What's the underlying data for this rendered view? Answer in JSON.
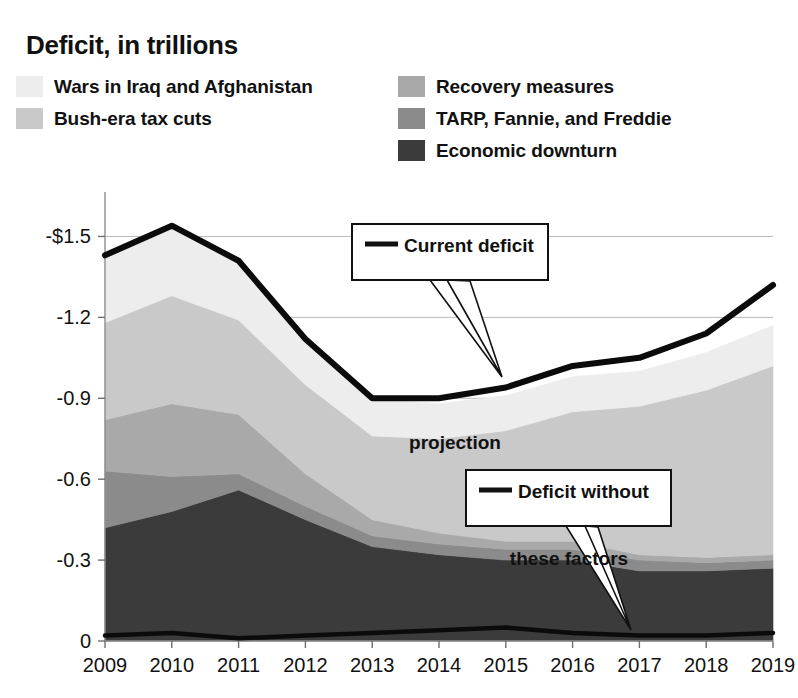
{
  "title": "Deficit, in trillions",
  "legend": {
    "left_items": [
      {
        "label": "Wars in Iraq and Afghanistan",
        "color": "#ededed",
        "key": "wars"
      },
      {
        "label": "Bush-era tax cuts",
        "color": "#c9c9c9",
        "key": "bush"
      }
    ],
    "right_items": [
      {
        "label": "Recovery measures",
        "color": "#a9a9a9",
        "key": "recovery"
      },
      {
        "label": "TARP, Fannie, and Freddie",
        "color": "#8b8b8b",
        "key": "tarp"
      },
      {
        "label": "Economic downturn",
        "color": "#3b3b3b",
        "key": "downturn"
      }
    ]
  },
  "annotations": [
    {
      "key": "current-deficit-projection",
      "line1": "Current deficit",
      "line2": "projection",
      "swatch_color": "#111111"
    },
    {
      "key": "deficit-without-these-factors",
      "line1": "Deficit without",
      "line2": "these factors",
      "swatch_color": "#111111"
    }
  ],
  "chart_data": {
    "type": "area",
    "stacked": true,
    "title": "Deficit, in trillions",
    "xlabel": "",
    "ylabel": "",
    "grid": true,
    "legend_position": "top",
    "note": "Stacked area of deficit components, plotted as negative trillions of dollars; magnitudes below are absolute trillions stacked from the zero baseline downward.",
    "x": [
      2009,
      2010,
      2011,
      2012,
      2013,
      2014,
      2015,
      2016,
      2017,
      2018,
      2019
    ],
    "xtick_labels": [
      "2009",
      "2010",
      "2011",
      "2012",
      "2013",
      "2014",
      "2015",
      "2016",
      "2017",
      "2018",
      "2019"
    ],
    "ytick_labels": [
      "-$1.5",
      "-1.2",
      "-0.9",
      "-0.6",
      "-0.3",
      "0"
    ],
    "ytick_values": [
      -1.5,
      -1.2,
      -0.9,
      -0.6,
      -0.3,
      0
    ],
    "ylim": [
      -1.65,
      0
    ],
    "xlim": [
      2009,
      2019
    ],
    "series": [
      {
        "name": "Economic downturn",
        "color": "#3b3b3b",
        "values": [
          0.42,
          0.48,
          0.56,
          0.45,
          0.35,
          0.32,
          0.3,
          0.3,
          0.26,
          0.26,
          0.27
        ]
      },
      {
        "name": "TARP, Fannie, and Freddie",
        "color": "#8b8b8b",
        "values": [
          0.21,
          0.13,
          0.06,
          0.05,
          0.04,
          0.04,
          0.04,
          0.04,
          0.04,
          0.03,
          0.03
        ]
      },
      {
        "name": "Recovery measures",
        "color": "#a9a9a9",
        "values": [
          0.19,
          0.27,
          0.22,
          0.12,
          0.06,
          0.04,
          0.03,
          0.03,
          0.02,
          0.02,
          0.02
        ]
      },
      {
        "name": "Bush-era tax cuts",
        "color": "#c9c9c9",
        "values": [
          0.36,
          0.4,
          0.35,
          0.33,
          0.31,
          0.35,
          0.41,
          0.48,
          0.55,
          0.62,
          0.7
        ]
      },
      {
        "name": "Wars in Iraq and Afghanistan",
        "color": "#ededed",
        "values": [
          0.25,
          0.26,
          0.22,
          0.17,
          0.14,
          0.13,
          0.13,
          0.13,
          0.13,
          0.14,
          0.15
        ]
      }
    ],
    "lines": [
      {
        "name": "Current deficit projection",
        "color": "#0b0b0b",
        "values": [
          -1.43,
          -1.54,
          -1.41,
          -1.12,
          -0.9,
          -0.9,
          -0.94,
          -1.02,
          -1.05,
          -1.14,
          -1.32
        ]
      },
      {
        "name": "Deficit without these factors",
        "color": "#0b0b0b",
        "values": [
          -0.02,
          -0.03,
          -0.01,
          -0.02,
          -0.03,
          -0.04,
          -0.05,
          -0.03,
          -0.02,
          -0.02,
          -0.03
        ]
      }
    ]
  }
}
